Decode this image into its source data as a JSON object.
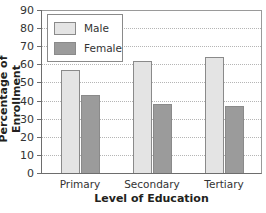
{
  "chart_data": {
    "type": "bar",
    "title": "",
    "xlabel": "Level of Education",
    "ylabel": "Percentage of Enrollment",
    "ylim": [
      0,
      90
    ],
    "yticks": [
      0,
      10,
      20,
      30,
      40,
      50,
      60,
      70,
      80,
      90
    ],
    "grid": true,
    "legend_position": "upper left",
    "categories": [
      "Primary",
      "Secondary",
      "Tertiary"
    ],
    "series": [
      {
        "name": "Male",
        "color": "#e4e4e4",
        "values": [
          57,
          62,
          64
        ]
      },
      {
        "name": "Female",
        "color": "#9b9b9b",
        "values": [
          43,
          38,
          37
        ]
      }
    ]
  },
  "axes": {
    "x_title": "Level of Education",
    "y_title": "Percentage of Enrollment",
    "y_tick_labels": [
      "0",
      "10",
      "20",
      "30",
      "40",
      "50",
      "60",
      "70",
      "80",
      "90"
    ],
    "x_tick_labels": [
      "Primary",
      "Secondary",
      "Tertiary"
    ]
  },
  "legend": {
    "items": [
      {
        "label": "Male",
        "color": "#e4e4e4"
      },
      {
        "label": "Female",
        "color": "#9b9b9b"
      }
    ]
  }
}
